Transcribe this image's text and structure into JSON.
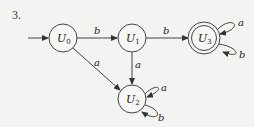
{
  "problem_number": "3.",
  "states": [
    {
      "id": "U0",
      "label": "U",
      "sub": "0",
      "x": 63,
      "y": 38,
      "start": true,
      "accept": false
    },
    {
      "id": "U1",
      "label": "U",
      "sub": "1",
      "x": 132,
      "y": 38,
      "start": false,
      "accept": false
    },
    {
      "id": "U2",
      "label": "U",
      "sub": "2",
      "x": 132,
      "y": 99,
      "start": false,
      "accept": false
    },
    {
      "id": "U3",
      "label": "U",
      "sub": "3",
      "x": 204,
      "y": 38,
      "start": false,
      "accept": true
    }
  ],
  "transitions": [
    {
      "from": "U0",
      "to": "U1",
      "symbol": "b"
    },
    {
      "from": "U1",
      "to": "U3",
      "symbol": "b"
    },
    {
      "from": "U0",
      "to": "U2",
      "symbol": "a"
    },
    {
      "from": "U1",
      "to": "U2",
      "symbol": "a"
    },
    {
      "from": "U2",
      "to": "U2",
      "symbol": "a"
    },
    {
      "from": "U2",
      "to": "U2",
      "symbol": "b"
    },
    {
      "from": "U3",
      "to": "U3",
      "symbol": "a"
    },
    {
      "from": "U3",
      "to": "U3",
      "symbol": "b"
    }
  ]
}
